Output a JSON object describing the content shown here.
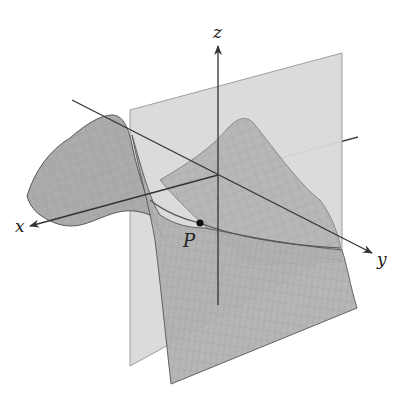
{
  "figure": {
    "axes": {
      "x_label": "x",
      "y_label": "y",
      "z_label": "z"
    },
    "point": {
      "label": "P"
    },
    "colors": {
      "background": "#ffffff",
      "plane_fill": "#d9d9d9",
      "surface_fill": "#a9a9a9",
      "surface_grid": "#8a8a8a",
      "axis": "#333333",
      "curve": "#555555",
      "point": "#111111"
    }
  }
}
